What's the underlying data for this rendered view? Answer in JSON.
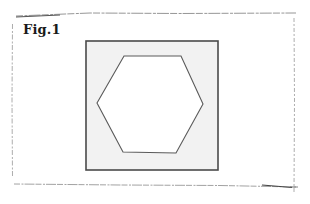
{
  "figure": {
    "label": "Fig.1",
    "frame": {
      "stroke": "#8a8a8a",
      "x1": 12,
      "y1": 14,
      "x2": 294,
      "y2": 187
    },
    "square": {
      "x": 86,
      "y": 41,
      "width": 132,
      "height": 129,
      "fill": "#f2f2f2",
      "stroke": "#4a4a4a"
    },
    "hexagon": {
      "points": "124,56 181,56 203,104 176,153 123,152 97,103",
      "fill": "#ffffff",
      "stroke": "#5a5a5a"
    }
  }
}
